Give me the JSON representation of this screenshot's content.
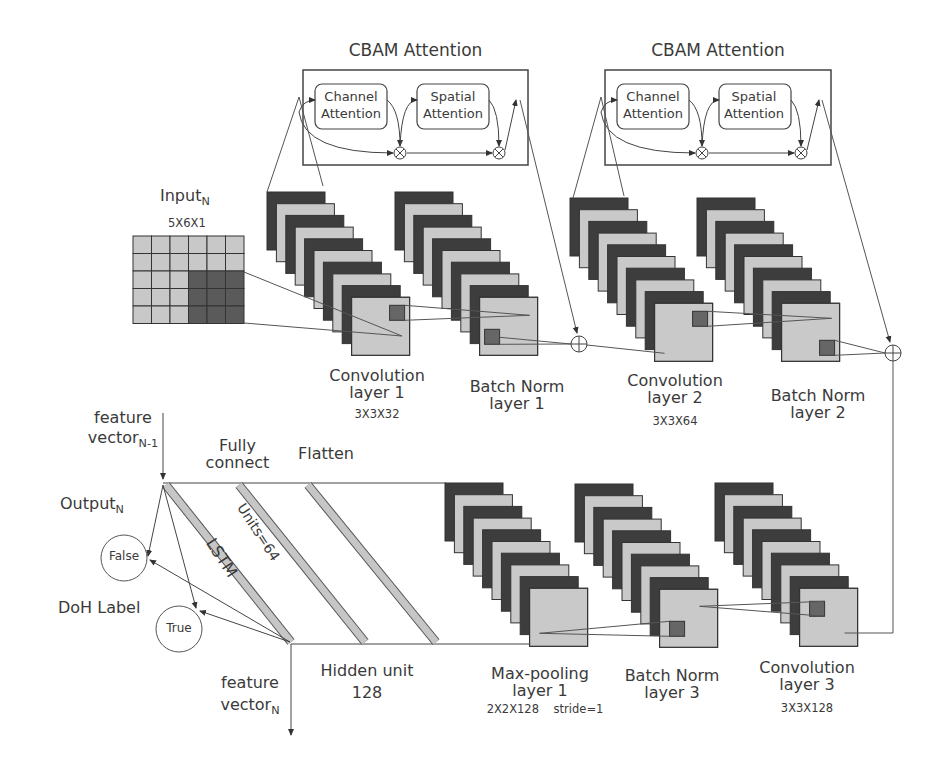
{
  "colors": {
    "dark": "#3d3d3d",
    "light": "#c9c9c9",
    "patch": "#666666",
    "line": "#555555",
    "text": "#3a3a3a"
  },
  "cbam": [
    {
      "title": "CBAM Attention",
      "channel": [
        "Channel",
        "Attention"
      ],
      "spatial": [
        "Spatial",
        "Attention"
      ],
      "x": 303,
      "y": 70,
      "w": 225,
      "h": 95
    },
    {
      "title": "CBAM Attention",
      "channel": [
        "Channel",
        "Attention"
      ],
      "spatial": [
        "Spatial",
        "Attention"
      ],
      "x": 605,
      "y": 70,
      "w": 226,
      "h": 95
    }
  ],
  "input": {
    "label": "Input",
    "sub": "N",
    "shape": "5X6X1",
    "rows": 5,
    "cols": 6,
    "dark_cells": [
      [
        2,
        3
      ],
      [
        2,
        4
      ],
      [
        2,
        5
      ],
      [
        3,
        3
      ],
      [
        3,
        4
      ],
      [
        3,
        5
      ],
      [
        4,
        3
      ],
      [
        4,
        4
      ],
      [
        4,
        5
      ]
    ]
  },
  "layers_top": [
    {
      "name": "Convolution",
      "name2": "layer 1",
      "params": "3X3X32",
      "x": 267,
      "y": 192
    },
    {
      "name": "Batch Norm",
      "name2": "layer 1",
      "params": "",
      "x": 395,
      "y": 192
    },
    {
      "name": "Convolution",
      "name2": "layer 2",
      "params": "3X3X64",
      "x": 570,
      "y": 198
    },
    {
      "name": "Batch Norm",
      "name2": "layer 2",
      "params": "",
      "x": 697,
      "y": 198
    }
  ],
  "layers_bottom": [
    {
      "name": "Max-pooling",
      "name2": "layer 1",
      "params": "2X2X128    stride=1",
      "x": 445,
      "y": 483
    },
    {
      "name": "Batch Norm",
      "name2": "layer 3",
      "params": "",
      "x": 575,
      "y": 484
    },
    {
      "name": "Convolution",
      "name2": "layer 3",
      "params": "3X3X128",
      "x": 715,
      "y": 483
    }
  ],
  "lstm_section": {
    "feature_in": [
      "feature",
      "vector"
    ],
    "feature_in_sub": "N-1",
    "feature_out": [
      "feature",
      "vector"
    ],
    "feature_out_sub": "N",
    "output_label": "Output",
    "output_sub": "N",
    "doh_label": "DoH Label",
    "false_label": "False",
    "true_label": "True",
    "fully_connect": [
      "Fully",
      "connect"
    ],
    "flatten": "Flatten",
    "lstm": "LSTM",
    "units": "Units=64",
    "hidden_unit": [
      "Hidden unit",
      "128"
    ]
  }
}
